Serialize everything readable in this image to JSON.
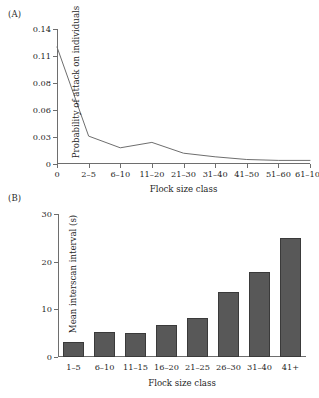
{
  "figure": {
    "panel_a_label": "(A)",
    "panel_b_label": "(B)"
  },
  "chart_data": [
    {
      "type": "line",
      "panel": "(A)",
      "title": "",
      "xlabel": "Flock size class",
      "ylabel": "Probability of attack on individuals",
      "categories": [
        "0",
        "2–5",
        "6–10",
        "11–20",
        "21–30",
        "31–40",
        "41–50",
        "51–60",
        "61–100"
      ],
      "values": [
        0.12,
        0.031,
        0.018,
        0.024,
        0.012,
        0.008,
        0.005,
        0.004,
        0.004
      ],
      "ytick_labels": [
        "0",
        "0.03",
        "0.06",
        "0.08",
        "0.11",
        "0.14"
      ],
      "ytick_values": [
        0,
        0.03,
        0.06,
        0.08,
        0.11,
        0.14
      ],
      "ylim": [
        0,
        0.14
      ],
      "grid": false,
      "legend": "none",
      "line_color": "#6e6e6e"
    },
    {
      "type": "bar",
      "panel": "(B)",
      "title": "",
      "xlabel": "Flock size class",
      "ylabel": "Mean interscan interval (s)",
      "categories": [
        "1–5",
        "6–10",
        "11–15",
        "16–20",
        "21–25",
        "26–30",
        "31–40",
        "41+"
      ],
      "values": [
        3.2,
        5.2,
        5.0,
        6.7,
        8.2,
        13.6,
        17.8,
        25.0
      ],
      "ytick_labels": [
        "0",
        "10",
        "20",
        "30"
      ],
      "ytick_values": [
        0,
        10,
        20,
        30
      ],
      "ylim": [
        0,
        30
      ],
      "grid": false,
      "legend": "none",
      "bar_color": "#585858",
      "bar_edge_color": "#3a3a3a"
    }
  ]
}
